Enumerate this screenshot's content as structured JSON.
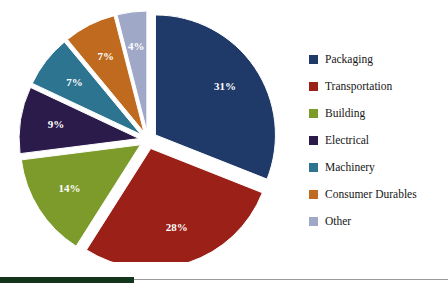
{
  "chart_data": {
    "type": "pie",
    "title": "",
    "subtitle": "",
    "xlabel": "",
    "ylabel": "",
    "legend_position": "right",
    "exploded": true,
    "label_format": "percent",
    "categories": [
      "Packaging",
      "Transportation",
      "Building",
      "Electrical",
      "Machinery",
      "Consumer Durables",
      "Other"
    ],
    "values": [
      31,
      28,
      14,
      9,
      7,
      7,
      4
    ],
    "labels": [
      "31%",
      "28%",
      "14%",
      "9%",
      "7%",
      "7%",
      "4%"
    ],
    "colors": [
      "#1F3A68",
      "#9B2017",
      "#7D9B2B",
      "#2A1B4A",
      "#2D7490",
      "#BF6A1E",
      "#A0A8C8"
    ],
    "slices": [
      {
        "name": "Packaging",
        "value": 31,
        "label": "31%",
        "color": "#1F3A68"
      },
      {
        "name": "Transportation",
        "value": 28,
        "label": "28%",
        "color": "#9B2017"
      },
      {
        "name": "Building",
        "value": 14,
        "label": "14%",
        "color": "#7D9B2B"
      },
      {
        "name": "Electrical",
        "value": 9,
        "label": "9%",
        "color": "#2A1B4A"
      },
      {
        "name": "Machinery",
        "value": 7,
        "label": "7%",
        "color": "#2D7490"
      },
      {
        "name": "Consumer Durables",
        "value": 7,
        "label": "7%",
        "color": "#BF6A1E"
      },
      {
        "name": "Other",
        "value": 4,
        "label": "4%",
        "color": "#A0A8C8"
      }
    ]
  },
  "legend": {
    "items": [
      {
        "label": "Packaging",
        "color": "#1F3A68"
      },
      {
        "label": "Transportation",
        "color": "#9B2017"
      },
      {
        "label": "Building",
        "color": "#7D9B2B"
      },
      {
        "label": "Electrical",
        "color": "#2A1B4A"
      },
      {
        "label": "Machinery",
        "color": "#2D7490"
      },
      {
        "label": "Consumer Durables",
        "color": "#BF6A1E"
      },
      {
        "label": "Other",
        "color": "#A0A8C8"
      }
    ]
  },
  "footer": {
    "accent_color": "#13351A",
    "rule_color": "#9A9A9A"
  }
}
